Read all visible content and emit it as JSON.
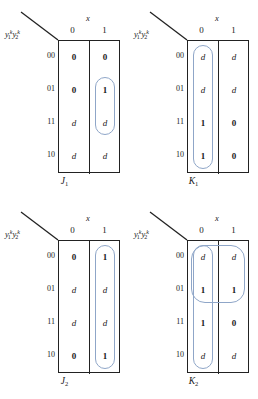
{
  "figure": {
    "type": "karnaugh-map-set",
    "count": 4,
    "row_var_label": {
      "base1": "y",
      "sub1": "1",
      "sup1": "k",
      "base2": "y",
      "sub2": "2",
      "sup2": "k"
    },
    "column_variable": "x",
    "column_headers": [
      "0",
      "1"
    ],
    "row_headers": [
      "00",
      "01",
      "11",
      "10"
    ]
  },
  "maps": [
    {
      "id": "J1",
      "name": "J",
      "subscript": "1",
      "position": "top-left",
      "cells": {
        "c0": [
          "0",
          "0",
          "d",
          "d"
        ],
        "c1": [
          "0",
          "1",
          "d",
          "d"
        ]
      },
      "groups": [
        {
          "name": "group-col1-rows-01-11",
          "col": 1,
          "row_start": 1,
          "row_span": 2
        }
      ]
    },
    {
      "id": "K1",
      "name": "K",
      "subscript": "1",
      "position": "top-right",
      "cells": {
        "c0": [
          "d",
          "d",
          "1",
          "1"
        ],
        "c1": [
          "d",
          "d",
          "0",
          "0"
        ]
      },
      "groups": [
        {
          "name": "group-col0-all-rows",
          "col": 0,
          "row_start": 0,
          "row_span": 4
        }
      ]
    },
    {
      "id": "J2",
      "name": "J",
      "subscript": "2",
      "position": "bottom-left",
      "cells": {
        "c0": [
          "0",
          "d",
          "d",
          "0"
        ],
        "c1": [
          "1",
          "d",
          "d",
          "1"
        ]
      },
      "groups": [
        {
          "name": "group-col1-all-rows",
          "col": 1,
          "row_start": 0,
          "row_span": 4
        }
      ]
    },
    {
      "id": "K2",
      "name": "K",
      "subscript": "2",
      "position": "bottom-right",
      "cells": {
        "c0": [
          "d",
          "1",
          "1",
          "d"
        ],
        "c1": [
          "d",
          "1",
          "0",
          "d"
        ]
      },
      "groups": [
        {
          "name": "group-col0-all-rows",
          "col": 0,
          "row_start": 0,
          "row_span": 4
        },
        {
          "name": "group-both-cols-rows-00-01",
          "col": 0,
          "row_start": 0,
          "row_span": 2,
          "col_span": 2
        }
      ]
    }
  ],
  "colors": {
    "grid_line": "#222222",
    "group_outline": "#8fa6c8",
    "text": "#1a1a1a",
    "background": "#ffffff"
  }
}
